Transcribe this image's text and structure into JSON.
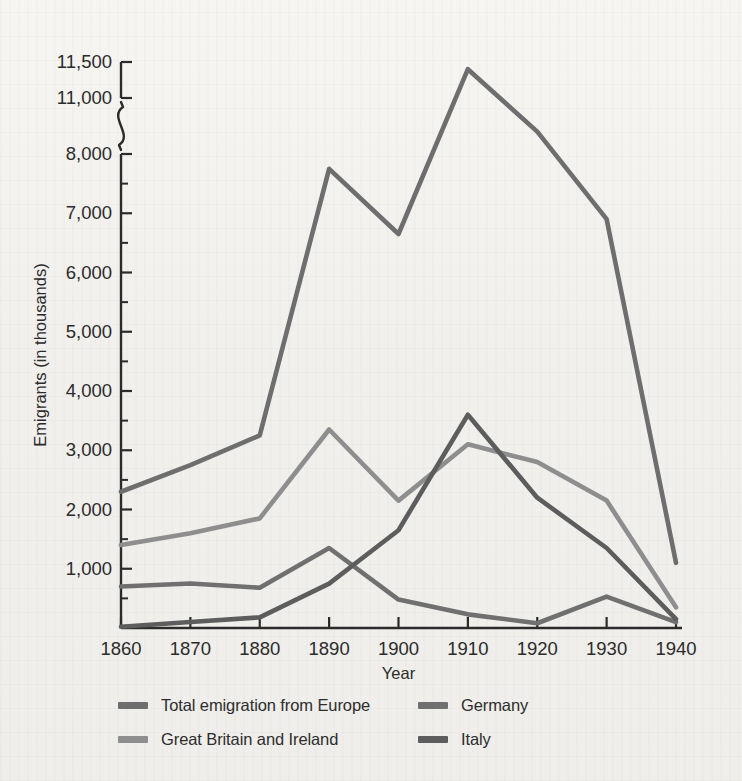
{
  "chart_data": {
    "type": "line",
    "title": "",
    "xlabel": "Year",
    "ylabel": "Emigrants (in thousands)",
    "x": [
      1860,
      1870,
      1880,
      1890,
      1900,
      1910,
      1920,
      1930,
      1940
    ],
    "xtick_labels": [
      "1860",
      "1870",
      "1880",
      "1890",
      "1900",
      "1910",
      "1920",
      "1930",
      "1940"
    ],
    "xlim": [
      1860,
      1940
    ],
    "ylim": [
      0,
      11500
    ],
    "ytick_labels": [
      "1,000",
      "2,000",
      "3,000",
      "4,000",
      "5,000",
      "6,000",
      "7,000",
      "8,000",
      "11,000",
      "11,500"
    ],
    "ytick_values": [
      1000,
      2000,
      3000,
      4000,
      5000,
      6000,
      7000,
      8000,
      11000,
      11500
    ],
    "minor_tick_values": [
      500,
      1500,
      2500,
      3500,
      4500,
      5500,
      6500,
      7500,
      8500
    ],
    "axis_break": {
      "present": true,
      "between": [
        8000,
        11000
      ],
      "style": "squiggle"
    },
    "grid": false,
    "legend_position": "below-plot",
    "series": [
      {
        "name": "Total emigration from Europe",
        "color": "#6e6e6e",
        "values": [
          2300,
          2750,
          3250,
          7750,
          6650,
          11400,
          9200,
          6900,
          1100
        ]
      },
      {
        "name": "Great Britain and Ireland",
        "color": "#8e8e8e",
        "values": [
          1400,
          1600,
          1850,
          3350,
          2150,
          3100,
          2800,
          2150,
          350
        ]
      },
      {
        "name": "Germany",
        "color": "#707070",
        "values": [
          700,
          750,
          680,
          1350,
          480,
          230,
          80,
          530,
          100
        ]
      },
      {
        "name": "Italy",
        "color": "#5d5d5d",
        "values": [
          20,
          100,
          180,
          750,
          1650,
          3600,
          2200,
          1350,
          150
        ]
      }
    ]
  },
  "legend": {
    "entries": [
      {
        "label": "Total emigration from Europe",
        "color": "#6e6e6e"
      },
      {
        "label": "Great Britain and Ireland",
        "color": "#8e8e8e"
      },
      {
        "label": "Germany",
        "color": "#707070"
      },
      {
        "label": "Italy",
        "color": "#5d5d5d"
      }
    ]
  },
  "colors": {
    "background": "#f3f2ef",
    "axis": "#2b2b2b",
    "text": "#2b2b2b"
  }
}
